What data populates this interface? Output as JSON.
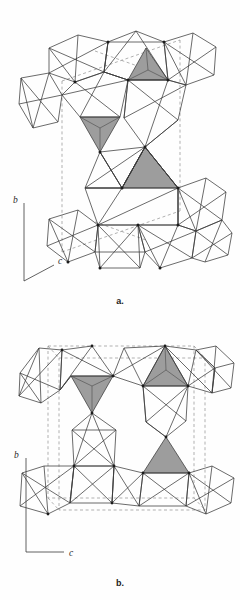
{
  "figure": {
    "title": "",
    "background_color": "#fefefe",
    "line_color": "#3a3a3a",
    "shade_color": "#9d9d9d",
    "dash_color": "#8f8f8f",
    "panels": [
      {
        "id": "a",
        "caption": "a.",
        "axes": {
          "type": "oblique",
          "vertical_label": "b",
          "oblique_label": "c",
          "oblique_direction": "down-right"
        },
        "content": {
          "description": "Polyhedral crystal structure projection with corner-linked octahedra and shaded tetrahedra, dashed unit cell outline",
          "shaded_tetrahedra": 3,
          "shaded_tetrahedra_orientations": [
            "apex-up",
            "apex-down",
            "apex-up"
          ],
          "unit_cell_outline": "dashed"
        }
      },
      {
        "id": "b",
        "caption": "b.",
        "axes": {
          "type": "orthogonal",
          "vertical_label": "b",
          "horizontal_label": "c",
          "horizontal_direction": "right"
        },
        "content": {
          "description": "Polyhedral crystal structure projection with corner-linked octahedra and shaded tetrahedra, dashed unit cell outline",
          "shaded_tetrahedra": 3,
          "shaded_tetrahedra_orientations": [
            "apex-down",
            "apex-up",
            "apex-up"
          ],
          "unit_cell_outline": "dashed"
        }
      }
    ]
  },
  "axis_labels": {
    "b": "b",
    "c": "c"
  }
}
